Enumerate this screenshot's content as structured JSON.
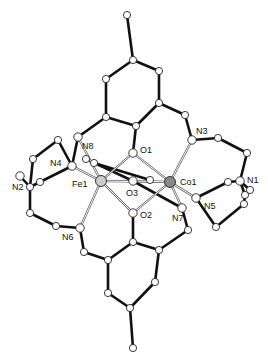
{
  "diagram": {
    "type": "molecular-structure",
    "metals": [
      "Fe1",
      "Co1"
    ],
    "labels": [
      {
        "id": "N3",
        "text": "N3"
      },
      {
        "id": "O1",
        "text": "O1"
      },
      {
        "id": "N8",
        "text": "N8"
      },
      {
        "id": "N4",
        "text": "N4"
      },
      {
        "id": "N2",
        "text": "N2"
      },
      {
        "id": "Fe1",
        "text": "Fe1"
      },
      {
        "id": "O3",
        "text": "O3"
      },
      {
        "id": "Co1",
        "text": "Co1"
      },
      {
        "id": "N1",
        "text": "N1"
      },
      {
        "id": "N5",
        "text": "N5"
      },
      {
        "id": "N7",
        "text": "N7"
      },
      {
        "id": "O2",
        "text": "O2"
      },
      {
        "id": "N6",
        "text": "N6"
      }
    ]
  }
}
